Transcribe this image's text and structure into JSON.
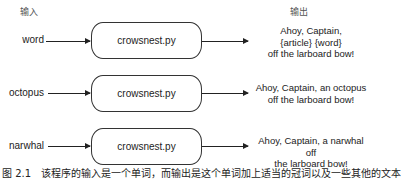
{
  "headers": {
    "input": "输入",
    "output": "输出"
  },
  "rows": [
    {
      "input": "word",
      "program": "crowsnest.py",
      "output_lines": [
        "Ahoy, Captain,",
        "{article} {word}",
        "off the larboard bow!"
      ]
    },
    {
      "input": "octopus",
      "program": "crowsnest.py",
      "output_lines": [
        "Ahoy, Captain, an octopus",
        "off the larboard bow!"
      ]
    },
    {
      "input": "narwhal",
      "program": "crowsnest.py",
      "output_lines": [
        "Ahoy, Captain, a narwhal off",
        "the larboard bow!"
      ]
    }
  ],
  "caption": "图 2.1　该程序的输入是一个单词，而输出是这个单词加上适当的冠词以及一些其他的文本"
}
